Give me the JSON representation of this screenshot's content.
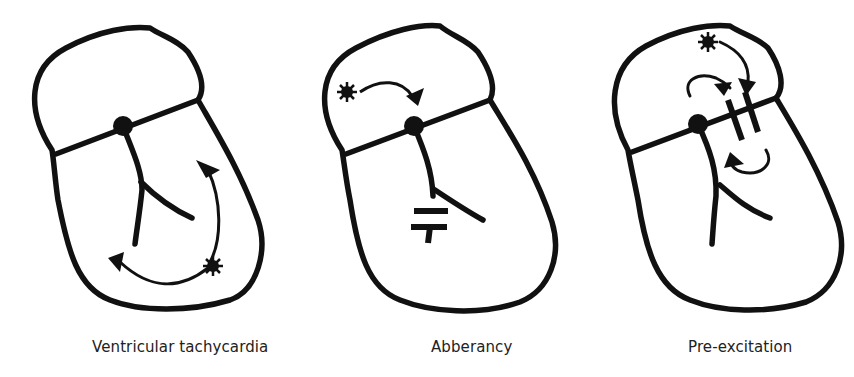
{
  "figure": {
    "panels": [
      {
        "id": "ventricular-tachycardia",
        "caption": "Ventricular tachycardia"
      },
      {
        "id": "abberancy",
        "caption": "Abberancy"
      },
      {
        "id": "pre-excitation",
        "caption": "Pre-excitation"
      }
    ],
    "colors": {
      "stroke": "#111111",
      "background": "#ffffff",
      "caption": "#222222"
    }
  }
}
